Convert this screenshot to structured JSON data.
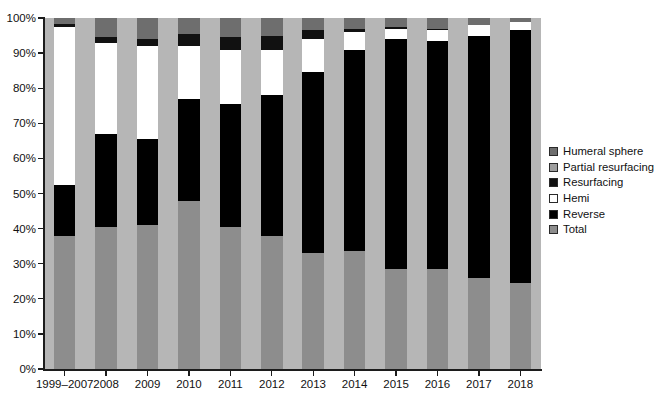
{
  "chart_data": {
    "type": "bar",
    "subtype": "stacked-100-percent",
    "title": "",
    "xlabel": "",
    "ylabel": "",
    "ylim": [
      0,
      100
    ],
    "ytick_labels": [
      "0%",
      "10%",
      "20%",
      "30%",
      "40%",
      "50%",
      "60%",
      "70%",
      "80%",
      "90%",
      "100%"
    ],
    "ytick_values": [
      0,
      10,
      20,
      30,
      40,
      50,
      60,
      70,
      80,
      90,
      100
    ],
    "grid": false,
    "legend_position": "right",
    "categories": [
      "1999–2007",
      "2008",
      "2009",
      "2010",
      "2011",
      "2012",
      "2013",
      "2014",
      "2015",
      "2016",
      "2017",
      "2018"
    ],
    "stack_order_bottom_to_top": [
      "Total",
      "Reverse",
      "Hemi",
      "Resurfacing",
      "Partial resurfacing",
      "Humeral sphere"
    ],
    "series": [
      {
        "name": "Total",
        "color": "#8d8d8d",
        "values": [
          38.0,
          40.5,
          41.0,
          48.0,
          40.5,
          38.0,
          33.0,
          33.5,
          28.5,
          28.5,
          26.0,
          24.5
        ]
      },
      {
        "name": "Reverse",
        "color": "#000000",
        "values": [
          14.5,
          26.5,
          24.5,
          29.0,
          35.0,
          40.0,
          51.5,
          57.5,
          65.5,
          65.0,
          69.0,
          72.0
        ]
      },
      {
        "name": "Hemi",
        "color": "#ffffff",
        "values": [
          45.0,
          26.0,
          26.5,
          15.0,
          15.5,
          13.0,
          9.5,
          5.0,
          3.0,
          3.0,
          3.0,
          2.5
        ]
      },
      {
        "name": "Resurfacing",
        "color": "#111111",
        "values": [
          0.7,
          1.5,
          2.0,
          3.5,
          3.5,
          4.0,
          2.5,
          1.0,
          0.5,
          0.5,
          0.0,
          0.0
        ]
      },
      {
        "name": "Partial resurfacing",
        "color": "#9e9e9e",
        "values": [
          0.0,
          0.0,
          0.0,
          0.0,
          0.0,
          0.0,
          0.0,
          0.0,
          0.0,
          0.0,
          0.0,
          0.0
        ]
      },
      {
        "name": "Humeral sphere",
        "color": "#6e6e6e",
        "values": [
          1.8,
          5.5,
          6.0,
          4.5,
          5.5,
          5.0,
          3.5,
          3.0,
          2.5,
          3.0,
          2.0,
          1.0
        ]
      }
    ],
    "legend": [
      {
        "label": "Humeral sphere",
        "color": "#6e6e6e"
      },
      {
        "label": "Partial resurfacing",
        "color": "#9e9e9e"
      },
      {
        "label": "Resurfacing",
        "color": "#111111"
      },
      {
        "label": "Hemi",
        "color": "#ffffff"
      },
      {
        "label": "Reverse",
        "color": "#000000"
      },
      {
        "label": "Total",
        "color": "#8d8d8d"
      }
    ],
    "plot_background_color": "#b6b6b6",
    "axis_color": "#1c1c1c"
  }
}
